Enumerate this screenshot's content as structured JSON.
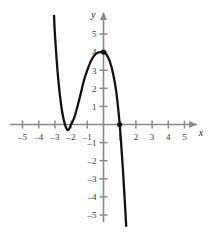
{
  "chart_data": {
    "type": "line",
    "title": "",
    "xlabel": "x",
    "ylabel": "y",
    "xlim": [
      -5.6,
      5.6
    ],
    "ylim": [
      -5.6,
      5.6
    ],
    "grid": false,
    "legend": null,
    "x_ticks": [
      -5,
      -4,
      -3,
      -2,
      -1,
      1,
      2,
      3,
      4,
      5
    ],
    "y_ticks": [
      -5,
      -4,
      -3,
      -2,
      -1,
      1,
      2,
      3,
      4,
      5
    ],
    "x_tick_labels": [
      "–5",
      "–4",
      "–3",
      "–2",
      "–1",
      "1",
      "2",
      "3",
      "4",
      "5"
    ],
    "y_tick_labels": [
      "–5",
      "–4",
      "–3",
      "–2",
      "–1",
      "1",
      "2",
      "3",
      "4",
      "5"
    ],
    "series": [
      {
        "name": "cubic-curve",
        "color": "#111111",
        "equation_points": [
          [
            -3.05,
            6.0
          ],
          [
            -3.0,
            5.0
          ],
          [
            -2.8,
            2.56
          ],
          [
            -2.6,
            0.98
          ],
          [
            -2.4,
            0.06
          ],
          [
            -2.2,
            -0.31
          ],
          [
            -2.0,
            0.0
          ],
          [
            -1.8,
            0.39
          ],
          [
            -1.6,
            1.02
          ],
          [
            -1.4,
            1.73
          ],
          [
            -1.2,
            2.46
          ],
          [
            -1.0,
            3.0
          ],
          [
            -0.8,
            3.46
          ],
          [
            -0.6,
            3.78
          ],
          [
            -0.4,
            3.95
          ],
          [
            -0.2,
            4.0
          ],
          [
            0.0,
            4.0
          ],
          [
            0.2,
            3.85
          ],
          [
            0.4,
            3.46
          ],
          [
            0.6,
            2.78
          ],
          [
            0.8,
            1.73
          ],
          [
            1.0,
            0.0
          ],
          [
            1.1,
            -1.2
          ],
          [
            1.2,
            -2.5
          ],
          [
            1.3,
            -4.0
          ],
          [
            1.4,
            -5.6
          ]
        ]
      }
    ],
    "marked_points": [
      {
        "name": "local-maximum-point",
        "x": 0,
        "y": 4
      },
      {
        "name": "x-intercept-point",
        "x": 1,
        "y": 0
      }
    ],
    "axis_color": "#8a8a8a",
    "curve_color": "#111111",
    "background_color": "#ffffff"
  },
  "labels": {
    "y_axis_name": "y",
    "x_axis_name": "x"
  }
}
